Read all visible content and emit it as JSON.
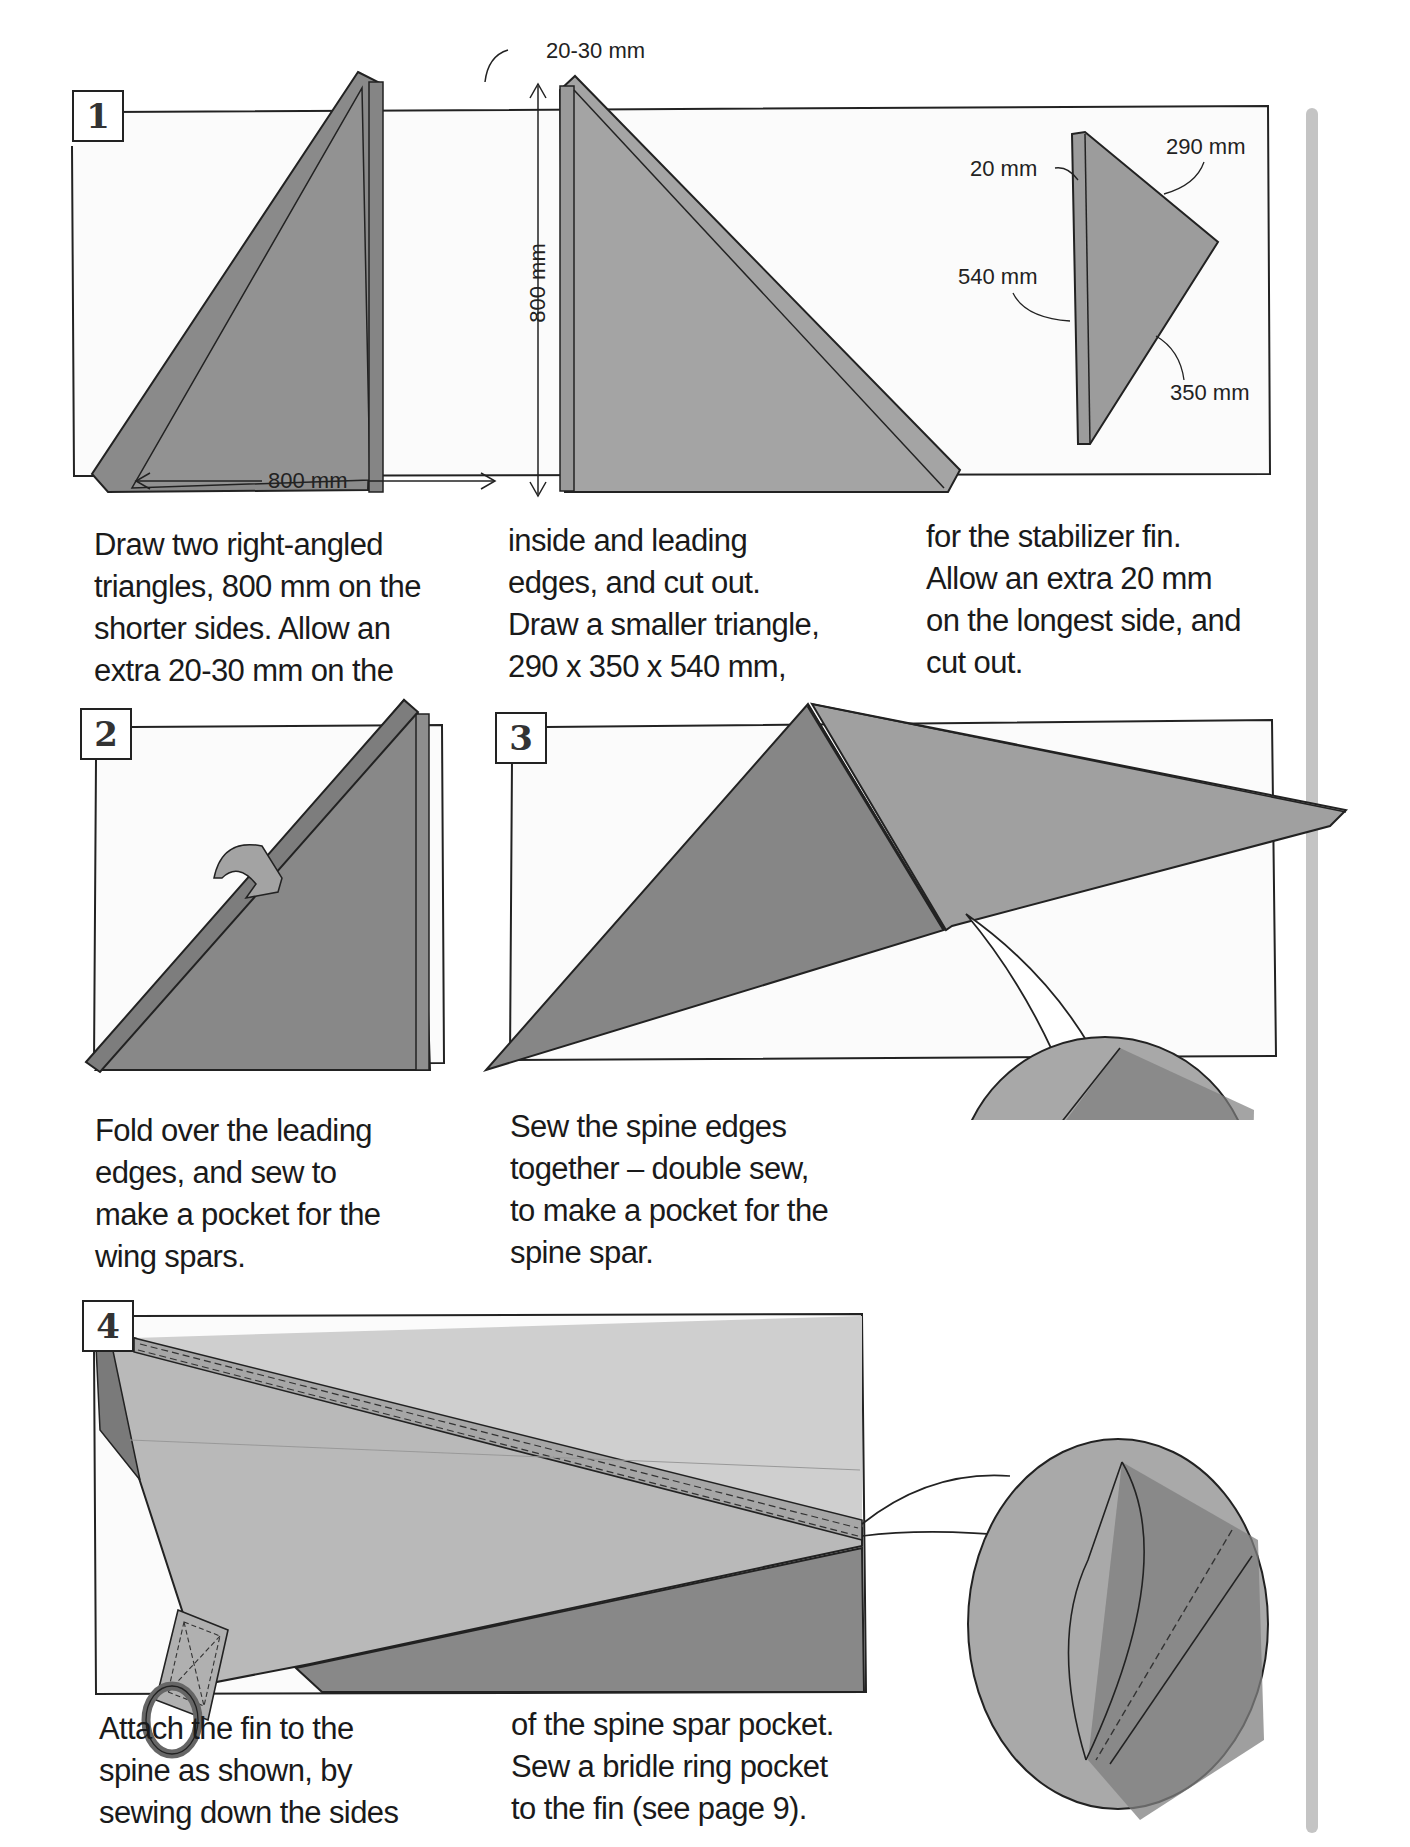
{
  "page": {
    "accent_color": "#808080",
    "frame_color": "#222222",
    "sidebar_color": "#c4c4c4"
  },
  "steps": [
    {
      "number": "1",
      "dimensions": {
        "extra_label": "20-30 mm",
        "vertical_label": "800 mm",
        "horizontal_label": "800 mm",
        "fin_extra": "20 mm",
        "fin_side_a": "290 mm",
        "fin_side_long": "540 mm",
        "fin_side_b": "350 mm"
      },
      "caption_columns": [
        [
          "Draw two right-angled",
          "triangles, 800 mm on the",
          "shorter sides. Allow an",
          "extra 20-30 mm on the"
        ],
        [
          "inside and leading",
          "edges, and cut out.",
          "Draw a smaller triangle,",
          "290 x 350 x 540 mm,"
        ],
        [
          "for the stabilizer fin.",
          "Allow an extra 20 mm",
          "on the longest side, and",
          "cut out."
        ]
      ]
    },
    {
      "number": "2",
      "caption_lines": [
        "Fold over the leading",
        "edges, and sew to",
        "make a pocket for the",
        "wing spars."
      ]
    },
    {
      "number": "3",
      "caption_lines": [
        "Sew the spine edges",
        "together – double sew,",
        "to make a pocket for the",
        "spine spar."
      ]
    },
    {
      "number": "4",
      "caption_columns": [
        [
          "Attach the fin to the",
          "spine as shown, by",
          "sewing down the sides"
        ],
        [
          "of the spine spar pocket.",
          "Sew a bridle ring pocket",
          "to the fin (see page 9)."
        ]
      ]
    }
  ]
}
